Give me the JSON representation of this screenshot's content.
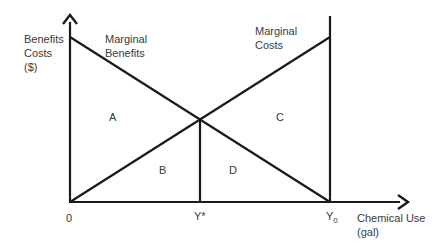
{
  "diagram": {
    "y_axis_label": [
      "Benefits",
      "Costs",
      "($)"
    ],
    "x_axis_label": [
      "Chemical Use",
      "(gal)"
    ],
    "curves": {
      "marginal_benefits": [
        "Marginal",
        "Benefits"
      ],
      "marginal_costs": [
        "Marginal",
        "Costs"
      ]
    },
    "regions": {
      "a": "A",
      "b": "B",
      "c": "C",
      "d": "D"
    },
    "x_ticks": {
      "origin": "0",
      "y_star": "Y*",
      "y0": "Y",
      "y0_sub": "0"
    },
    "line_color": "#1a1a1a"
  }
}
